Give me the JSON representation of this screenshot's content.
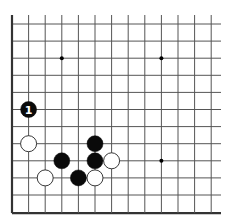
{
  "board": {
    "columns": 13,
    "rows": 12,
    "edges": {
      "left": true,
      "bottom": true,
      "top": false,
      "right": false
    },
    "line_color": "#555555",
    "edge_color": "#333333",
    "star_points": [
      {
        "col": 3,
        "row": 2
      },
      {
        "col": 9,
        "row": 2
      },
      {
        "col": 9,
        "row": 8
      }
    ]
  },
  "stones": [
    {
      "color": "black",
      "col": 1,
      "row": 5,
      "label": "1"
    },
    {
      "color": "white",
      "col": 1,
      "row": 7,
      "label": ""
    },
    {
      "color": "black",
      "col": 5,
      "row": 7,
      "label": ""
    },
    {
      "color": "black",
      "col": 3,
      "row": 8,
      "label": ""
    },
    {
      "color": "black",
      "col": 5,
      "row": 8,
      "label": ""
    },
    {
      "color": "white",
      "col": 6,
      "row": 8,
      "label": ""
    },
    {
      "color": "white",
      "col": 2,
      "row": 9,
      "label": ""
    },
    {
      "color": "black",
      "col": 4,
      "row": 9,
      "label": ""
    },
    {
      "color": "white",
      "col": 5,
      "row": 9,
      "label": ""
    }
  ],
  "colors": {
    "black_stone": "#0a0a0a",
    "white_stone": "#ffffff",
    "white_stone_outline": "#222222",
    "label_on_black": "#ffffff"
  }
}
